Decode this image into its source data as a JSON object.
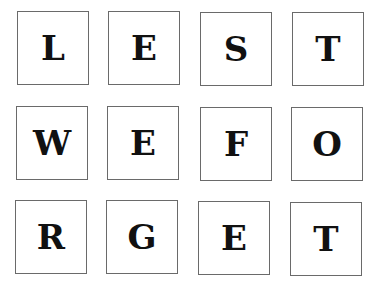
{
  "grid": {
    "rows": [
      [
        "L",
        "E",
        "S",
        "T"
      ],
      [
        "W",
        "E",
        "F",
        "O"
      ],
      [
        "R",
        "G",
        "E",
        "T"
      ]
    ]
  },
  "colors": {
    "border": "#6a6a6a",
    "text": "#111111",
    "background": "#ffffff"
  }
}
